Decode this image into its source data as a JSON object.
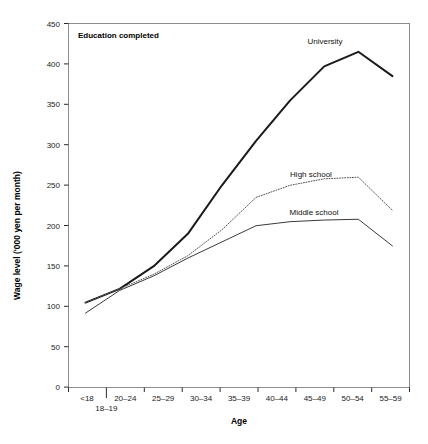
{
  "chart_data": {
    "type": "line",
    "title": "",
    "annotation": "Education completed",
    "xlabel": "Age",
    "ylabel": "Wage level ('000 yen per month)",
    "categories": [
      "<18",
      "18–19",
      "20–24",
      "25–29",
      "30–34",
      "35–39",
      "40–44",
      "45–49",
      "50–54",
      "55–59"
    ],
    "yticks": [
      0,
      50,
      100,
      150,
      200,
      250,
      300,
      350,
      400,
      450
    ],
    "ylim": [
      0,
      450
    ],
    "grid": false,
    "legend_position": "inline-labels",
    "series": [
      {
        "name": "University",
        "style": "solid-thick",
        "color": "#1a1a1a",
        "values": [
          105,
          122,
          150,
          190,
          250,
          305,
          355,
          397,
          415,
          385
        ]
      },
      {
        "name": "High school",
        "style": "dotted",
        "color": "#555555",
        "values": [
          105,
          122,
          140,
          163,
          195,
          235,
          250,
          258,
          260,
          219
        ]
      },
      {
        "name": "Middle school",
        "style": "solid-thin",
        "color": "#3a3a3a",
        "values": [
          92,
          120,
          138,
          160,
          180,
          200,
          205,
          207,
          208,
          175
        ]
      }
    ]
  },
  "axis": {
    "y_tick_labels": [
      "450",
      "400",
      "350",
      "300",
      "250",
      "200",
      "150",
      "100",
      "50",
      "0"
    ],
    "x_tick_labels": [
      "<18",
      "20–24",
      "25–29",
      "30–34",
      "35–39",
      "40–44",
      "45–49",
      "50–54",
      "55–59"
    ],
    "x_offset_label": "18–19",
    "x_axis_title": "Age",
    "y_axis_title": "Wage level ('000 yen per month)"
  },
  "labels": {
    "annotation_box": "Education completed",
    "university": "University",
    "high_school": "High school",
    "middle_school": "Middle school"
  }
}
